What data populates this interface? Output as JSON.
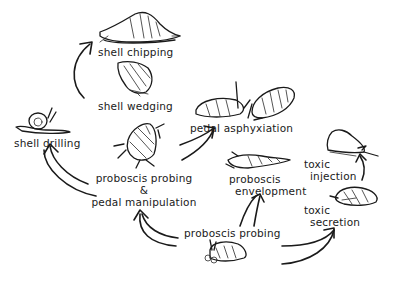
{
  "diagram": {
    "type": "flow",
    "background": "#ffffff",
    "ink_color": "#1a1a1a",
    "nodes": [
      {
        "id": "shell-chipping",
        "label": "shell chipping"
      },
      {
        "id": "shell-wedging",
        "label": "shell wedging"
      },
      {
        "id": "shell-drilling",
        "label": "shell drilling"
      },
      {
        "id": "pedal-asphyxiation",
        "label": "pedal asphyxiation"
      },
      {
        "id": "proboscis-probing-pedal",
        "label_line1": "proboscis probing",
        "label_line2": "&",
        "label_line3": "pedal manipulation"
      },
      {
        "id": "proboscis-envelopment",
        "label_line1": "proboscis",
        "label_line2": "envelopment"
      },
      {
        "id": "toxic-injection",
        "label_line1": "toxic",
        "label_line2": "injection"
      },
      {
        "id": "toxic-secretion",
        "label_line1": "toxic",
        "label_line2": "secretion"
      },
      {
        "id": "proboscis-probing",
        "label": "proboscis probing"
      }
    ],
    "edges": [
      {
        "from": "proboscis-probing",
        "to": "proboscis-probing-pedal"
      },
      {
        "from": "proboscis-probing",
        "to": "proboscis-envelopment"
      },
      {
        "from": "proboscis-probing",
        "to": "toxic-secretion"
      },
      {
        "from": "toxic-secretion",
        "to": "toxic-injection"
      },
      {
        "from": "proboscis-probing-pedal",
        "to": "shell-drilling"
      },
      {
        "from": "proboscis-probing-pedal",
        "to": "pedal-asphyxiation"
      },
      {
        "from": "shell-wedging",
        "to": "shell-chipping"
      }
    ],
    "illustrations": [
      {
        "id": "snail-shell-chipping",
        "icon": "snail-icon"
      },
      {
        "id": "snail-shell-wedging",
        "icon": "shell-icon"
      },
      {
        "id": "snail-shell-drilling",
        "icon": "snail-icon"
      },
      {
        "id": "snails-pedal-asphyxiation",
        "icon": "snail-pair-icon"
      },
      {
        "id": "crab-like-probing",
        "icon": "gastropod-icon"
      },
      {
        "id": "snail-proboscis-envelopment",
        "icon": "auger-shell-icon"
      },
      {
        "id": "cone-shell-toxic-injection",
        "icon": "cone-shell-icon"
      },
      {
        "id": "whelk-toxic-secretion",
        "icon": "whelk-icon"
      },
      {
        "id": "snail-proboscis-probing",
        "icon": "snail-icon"
      }
    ]
  }
}
